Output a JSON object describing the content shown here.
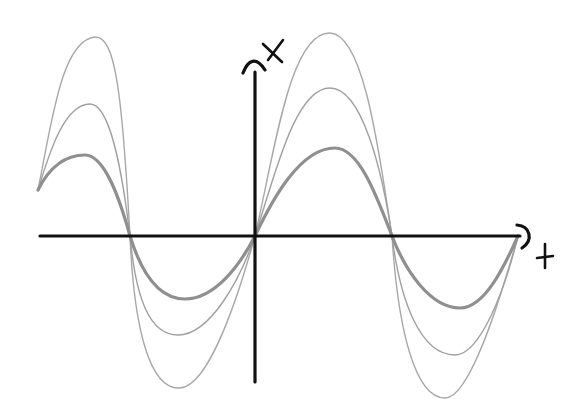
{
  "diagram": {
    "axes": {
      "horizontal_label": "t",
      "vertical_label": "x",
      "axis_color": "#111111"
    },
    "curves": [
      {
        "name": "large-amplitude",
        "color": "#a8a8a8",
        "stroke_width": 1.4
      },
      {
        "name": "medium-amplitude",
        "color": "#a0a0a0",
        "stroke_width": 1.4
      },
      {
        "name": "small-amplitude",
        "color": "#8f8f8f",
        "stroke_width": 3.2
      }
    ],
    "zero_crossings_px": [
      130,
      255,
      392,
      518
    ]
  }
}
